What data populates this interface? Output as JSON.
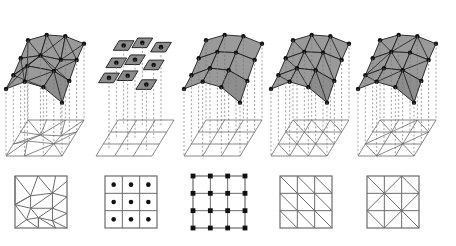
{
  "figure": {
    "title": "",
    "caption": "",
    "background_color": "#ffffff",
    "stroke_color": "#1a1a1a",
    "grid_stroke_color": "#6b6b6b",
    "surface_fill": "#8d8d8d",
    "surface_fill_light": "#9a9a9a",
    "dash_color": "#777777",
    "node_color": "#111111",
    "columns": 5,
    "rows": 3,
    "row_names": [
      "surface-mesh-3d",
      "projected-grid",
      "reference-cell-diagram"
    ]
  },
  "panels": [
    {
      "index": 0,
      "name": "irregular-triangulation",
      "label": "",
      "surface_type": "triangulated-irregular-surface",
      "bottom_type": "irregular-triangulation-square",
      "node_count": 17,
      "cell_count": 22,
      "has_center_dots": false,
      "has_nodes": true,
      "diagonal_style": "irregular"
    },
    {
      "index": 1,
      "name": "piecewise-constant-cells",
      "label": "",
      "surface_type": "disconnected-flat-quads",
      "bottom_type": "cell-centered-dots-grid",
      "node_count": 9,
      "cell_count": 9,
      "has_center_dots": true,
      "has_nodes": false,
      "diagonal_style": "none"
    },
    {
      "index": 2,
      "name": "bilinear-quad-mesh",
      "label": "",
      "surface_type": "bilinear-quad-surface",
      "bottom_type": "node-centered-grid",
      "node_count": 16,
      "cell_count": 9,
      "has_center_dots": false,
      "has_nodes": true,
      "diagonal_style": "none"
    },
    {
      "index": 3,
      "name": "uniform-diagonal-triangulation",
      "label": "",
      "surface_type": "triangulated-quad-surface-single-diagonal",
      "bottom_type": "single-diagonal-triangulation",
      "node_count": 16,
      "cell_count": 18,
      "has_center_dots": false,
      "has_nodes": true,
      "diagonal_style": "forward-slash-uniform"
    },
    {
      "index": 4,
      "name": "criss-cross-triangulation",
      "label": "",
      "surface_type": "triangulated-quad-surface-alternating-diagonal",
      "bottom_type": "alternating-diagonal-triangulation",
      "node_count": 16,
      "cell_count": 18,
      "has_center_dots": false,
      "has_nodes": true,
      "diagonal_style": "alternating-union-jack"
    }
  ],
  "geometry": {
    "square_size": 52,
    "square_divisions": 3,
    "dot_radius": 2.3,
    "node_radius": 2.2,
    "grid_line_width": 1.0,
    "border_line_width": 1.2
  }
}
